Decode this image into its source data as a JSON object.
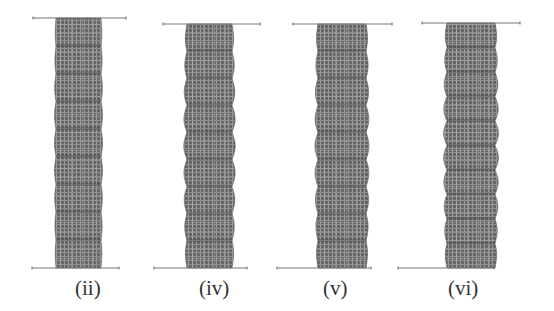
{
  "figure": {
    "width": 554,
    "height": 311,
    "background": "#ffffff",
    "mesh_color_dark": "#5c5c5c",
    "mesh_color_light": "#b4b4b4",
    "plate_line_color": "#777777",
    "panels": [
      {
        "label": "(ii)",
        "plate_top": {
          "y": 18,
          "x1": 33,
          "x2": 126
        },
        "plate_bottom": {
          "y": 268,
          "x1": 32,
          "x2": 119
        },
        "column": {
          "x_left": 56,
          "x_right": 101,
          "y_top": 18,
          "y_bottom": 268
        },
        "waves": 9,
        "amplitude": 1.5,
        "label_x": 75,
        "label_y": 295
      },
      {
        "label": "(iv)",
        "plate_top": {
          "y": 24,
          "x1": 163,
          "x2": 260
        },
        "plate_bottom": {
          "y": 268,
          "x1": 154,
          "x2": 247
        },
        "column": {
          "x_left": 187,
          "x_right": 232,
          "y_top": 24,
          "y_bottom": 268
        },
        "waves": 9,
        "amplitude": 3.2,
        "label_x": 199,
        "label_y": 295
      },
      {
        "label": "(v)",
        "plate_top": {
          "y": 24,
          "x1": 293,
          "x2": 392
        },
        "plate_bottom": {
          "y": 268,
          "x1": 277,
          "x2": 371
        },
        "column": {
          "x_left": 318,
          "x_right": 366,
          "y_top": 24,
          "y_bottom": 268
        },
        "waves": 9,
        "amplitude": 3.0,
        "label_x": 323,
        "label_y": 295
      },
      {
        "label": "(vi)",
        "plate_top": {
          "y": 23,
          "x1": 422,
          "x2": 520
        },
        "plate_bottom": {
          "y": 268,
          "x1": 398,
          "x2": 494
        },
        "column": {
          "x_left": 447,
          "x_right": 495,
          "y_top": 23,
          "y_bottom": 268
        },
        "waves": 10,
        "amplitude": 3.4,
        "label_x": 448,
        "label_y": 295
      }
    ]
  }
}
